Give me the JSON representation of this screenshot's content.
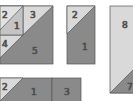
{
  "colors": {
    "light": "#d9d9d9",
    "dark": "#8a8a8a",
    "stroke": "#555555"
  },
  "blocks": {
    "a": {
      "labels": {
        "p2": "2",
        "p1": "1",
        "p3": "3",
        "p4": "4",
        "p5": "5"
      }
    },
    "b": {
      "labels": {
        "p2": "2",
        "p1": "1"
      }
    },
    "c": {
      "labels": {
        "p8": "8",
        "p7": "7"
      }
    },
    "d": {
      "labels": {
        "p2": "2",
        "p1": "1",
        "p3": "3"
      }
    }
  }
}
